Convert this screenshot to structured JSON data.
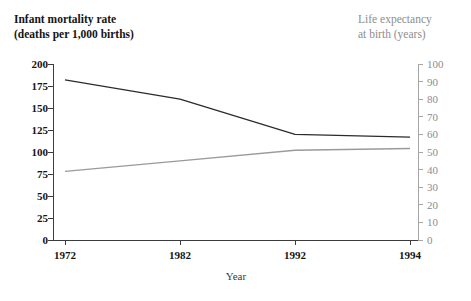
{
  "figure": {
    "left_heading": "Infant mortality rate\n(deaths per 1,000 births)",
    "right_heading": "Life expectancy\nat birth (years)",
    "x_axis_title": "Year"
  },
  "chart_data": {
    "type": "line",
    "title": "",
    "xlabel": "Year",
    "x": [
      "1972",
      "1982",
      "1992",
      "1994"
    ],
    "grid": false,
    "legend": "none",
    "series": [
      {
        "name": "Infant mortality rate (deaths per 1,000 births)",
        "axis": "left",
        "color": "#2b2b2b",
        "values": [
          182,
          160,
          120,
          117
        ]
      },
      {
        "name": "Life expectancy at birth (years)",
        "axis": "right",
        "color": "#9a9a9a",
        "values": [
          39,
          45,
          51,
          52
        ]
      }
    ],
    "left_axis": {
      "label": "Infant mortality rate (deaths per 1,000 births)",
      "ylim": [
        0,
        200
      ],
      "step": 25,
      "ticks": [
        "0",
        "25",
        "50",
        "75",
        "100",
        "125",
        "150",
        "175",
        "200"
      ],
      "color": "#141414"
    },
    "right_axis": {
      "label": "Life expectancy at birth (years)",
      "ylim": [
        0,
        100
      ],
      "step": 10,
      "ticks": [
        "0",
        "10",
        "20",
        "30",
        "40",
        "50",
        "60",
        "70",
        "80",
        "90",
        "100"
      ],
      "color": "#8d8d8d"
    }
  }
}
